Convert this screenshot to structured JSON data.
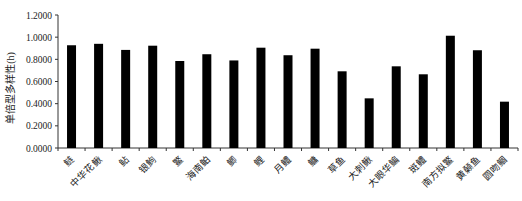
{
  "chart_data": {
    "type": "bar",
    "title": "",
    "xlabel": "",
    "ylabel": "单倍型多样性(h)",
    "ylim": [
      0,
      1.2
    ],
    "yticks": [
      "0.0000",
      "0.2000",
      "0.4000",
      "0.6000",
      "0.8000",
      "1.0000",
      "1.2000"
    ],
    "grid": false,
    "legend": null,
    "categories": [
      "鲢",
      "中华花鳅",
      "鲇",
      "银鮈",
      "鳘",
      "海南鲌",
      "鲫",
      "鲤",
      "月鳢",
      "鳙",
      "草鱼",
      "大刺鳅",
      "大眼华鳊",
      "斑鳢",
      "南方拟鳘",
      "黄颡鱼",
      "圆吻鲴"
    ],
    "values": [
      0.927,
      0.94,
      0.885,
      0.923,
      0.785,
      0.846,
      0.79,
      0.905,
      0.837,
      0.896,
      0.692,
      0.448,
      0.737,
      0.665,
      1.013,
      0.882,
      0.418
    ],
    "bar_color": "#000000"
  }
}
